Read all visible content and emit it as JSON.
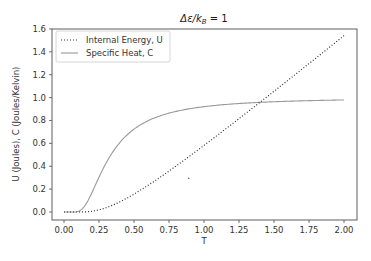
{
  "chart_data": {
    "type": "line",
    "title_parts": {
      "delta_eps": "Δε/k",
      "sub": "B",
      "rhs": " = 1"
    },
    "xlabel": "T",
    "ylabel": "U (Joules), C (Joules/Kelvin)",
    "xlim": [
      -0.1,
      2.1
    ],
    "ylim": [
      -0.08,
      1.6
    ],
    "x_ticks": [
      0.0,
      0.25,
      0.5,
      0.75,
      1.0,
      1.25,
      1.5,
      1.75,
      2.0
    ],
    "x_tick_labels": [
      "0.00",
      "0.25",
      "0.50",
      "0.75",
      "1.00",
      "1.25",
      "1.50",
      "1.75",
      "2.00"
    ],
    "y_ticks": [
      0.0,
      0.2,
      0.4,
      0.6,
      0.8,
      1.0,
      1.2,
      1.4,
      1.6
    ],
    "y_tick_labels": [
      "0.0",
      "0.2",
      "0.4",
      "0.6",
      "0.8",
      "1.0",
      "1.2",
      "1.4",
      "1.6"
    ],
    "grid": false,
    "legend_position": "upper left",
    "x": [
      0.0,
      0.05,
      0.1,
      0.15,
      0.2,
      0.25,
      0.3,
      0.35,
      0.4,
      0.45,
      0.5,
      0.6,
      0.7,
      0.8,
      0.9,
      1.0,
      1.1,
      1.2,
      1.3,
      1.4,
      1.5,
      1.6,
      1.7,
      1.8,
      1.9,
      2.0
    ],
    "series": [
      {
        "name": "Internal Energy, U",
        "style": "dotted",
        "color": "#333333",
        "values": [
          0.0,
          0.0,
          0.0,
          0.001,
          0.007,
          0.019,
          0.037,
          0.061,
          0.089,
          0.12,
          0.157,
          0.233,
          0.317,
          0.402,
          0.49,
          0.582,
          0.674,
          0.767,
          0.861,
          0.956,
          1.051,
          1.147,
          1.243,
          1.339,
          1.436,
          1.541
        ]
      },
      {
        "name": "Specific Heat, C",
        "style": "solid",
        "color": "#999999",
        "values": [
          0.0,
          0.0,
          0.005,
          0.057,
          0.171,
          0.294,
          0.401,
          0.487,
          0.557,
          0.614,
          0.724,
          0.786,
          0.829,
          0.861,
          0.886,
          0.921,
          0.934,
          0.944,
          0.952,
          0.958,
          0.963,
          0.968,
          0.971,
          0.974,
          0.977,
          0.979
        ]
      }
    ],
    "annotations": [
      {
        "type": "stray-point",
        "x": 0.89,
        "y": 0.3
      }
    ]
  },
  "legend": {
    "items": [
      {
        "label": "Internal Energy, U"
      },
      {
        "label": "Specific Heat, C"
      }
    ]
  }
}
